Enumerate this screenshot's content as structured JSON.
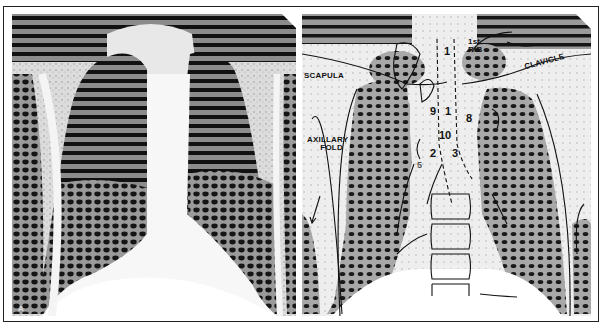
{
  "figure": {
    "panels": [
      {
        "id": "radiograph",
        "position": "left",
        "corner_marker": "A"
      },
      {
        "id": "annotated-tracing",
        "position": "right"
      }
    ]
  },
  "labels": {
    "first_rib_line1": "1st",
    "first_rib_line2": "RIB",
    "clavicle": "CLAVICLE",
    "scapula": "SCAPULA",
    "axillary_fold_line1": "AXILLARY",
    "axillary_fold_line2": "FOLD",
    "n1_top": "1",
    "n1_mid": "1",
    "n9": "9",
    "n8": "8",
    "n10": "10",
    "n2": "2",
    "n3": "3",
    "n5": "5"
  },
  "colors": {
    "background": "#ffffff",
    "lung_dark": "#1a1a1a",
    "lung_mid": "#8a8a8a",
    "soft_tissue": "#d8d8d8",
    "line": "#111111"
  }
}
